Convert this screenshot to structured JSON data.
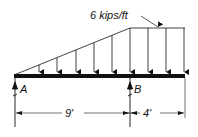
{
  "diagram": {
    "type": "beam-loading",
    "load_label": "6 kips/ft",
    "support_a_label": "A",
    "support_b_label": "B",
    "span_ab_label": "9'",
    "overhang_label": "4'",
    "colors": {
      "ink": "#111111",
      "background": "#ffffff"
    }
  }
}
